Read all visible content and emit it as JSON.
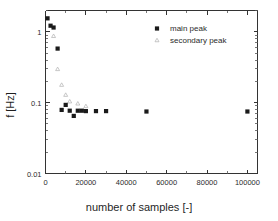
{
  "chart_data": {
    "type": "scatter",
    "title": "",
    "xlabel": "number of samples [-]",
    "ylabel": "f [Hz]",
    "xlim": [
      0,
      105000
    ],
    "ylim": [
      0.01,
      2
    ],
    "yscale": "log",
    "xscale": "linear",
    "grid": false,
    "legend_position": "top-right",
    "xticks": [
      0,
      20000,
      40000,
      60000,
      80000,
      100000
    ],
    "xtick_labels": [
      "0",
      "20000",
      "40000",
      "60000",
      "80000",
      "100000"
    ],
    "yticks": [
      1,
      0.1,
      0.01
    ],
    "ytick_labels": [
      "1",
      "0.1",
      "0.01"
    ],
    "series": [
      {
        "name": "main peak",
        "marker": "filled-square",
        "color": "#1a1a1a",
        "points": [
          {
            "x": 1000,
            "y": 1.55
          },
          {
            "x": 2500,
            "y": 1.22
          },
          {
            "x": 4000,
            "y": 1.15
          },
          {
            "x": 6000,
            "y": 0.58
          },
          {
            "x": 8000,
            "y": 0.079
          },
          {
            "x": 10000,
            "y": 0.093
          },
          {
            "x": 12000,
            "y": 0.077
          },
          {
            "x": 14000,
            "y": 0.065
          },
          {
            "x": 16000,
            "y": 0.077
          },
          {
            "x": 18000,
            "y": 0.077
          },
          {
            "x": 20000,
            "y": 0.076
          },
          {
            "x": 25000,
            "y": 0.076
          },
          {
            "x": 30000,
            "y": 0.076
          },
          {
            "x": 50000,
            "y": 0.075
          },
          {
            "x": 100000,
            "y": 0.075
          }
        ]
      },
      {
        "name": "secondary peak",
        "marker": "open-triangle",
        "color": "#b9b9b9",
        "points": [
          {
            "x": 4000,
            "y": 0.88
          },
          {
            "x": 6000,
            "y": 0.3
          },
          {
            "x": 8000,
            "y": 0.18
          },
          {
            "x": 10000,
            "y": 0.13
          },
          {
            "x": 12000,
            "y": 0.105
          },
          {
            "x": 16000,
            "y": 0.098
          },
          {
            "x": 20000,
            "y": 0.09
          }
        ]
      }
    ]
  },
  "legend": {
    "entries": [
      {
        "label": "main peak",
        "marker": "filled-square"
      },
      {
        "label": "secondary peak",
        "marker": "open-triangle"
      }
    ]
  },
  "axes": {
    "x_title": "number of samples [-]",
    "y_title": "f [Hz]"
  },
  "icons": {
    "main_marker": "filled-square-marker",
    "secondary_marker": "open-triangle-marker"
  }
}
